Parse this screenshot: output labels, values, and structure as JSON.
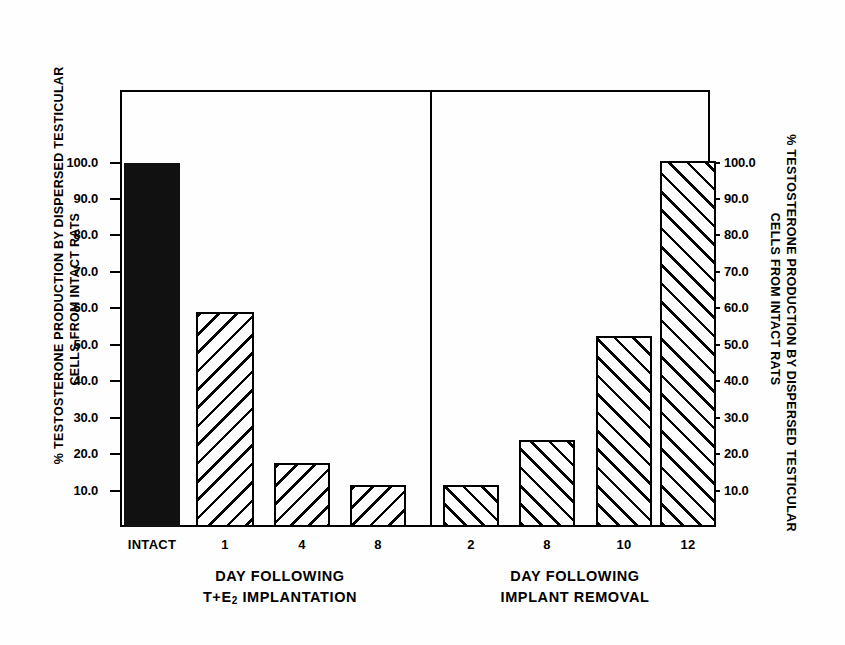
{
  "axis_titles": {
    "left": [
      "% TESTOSTERONE PRODUCTION BY DISPERSED TESTICULAR",
      "CELLS FROM INTACT RATS"
    ],
    "right": [
      "% TESTOSTERONE PRODUCTION BY DISPERSED TESTICULAR",
      "CELLS FROM INTACT RATS"
    ]
  },
  "tick_labels": [
    "100.0",
    "90.0",
    "80.0",
    "70.0",
    "60.0",
    "50.0",
    "40.0",
    "30.0",
    "20.0",
    "10.0"
  ],
  "groups": [
    {
      "caption": [
        "DAY FOLLOWING",
        "T+E2 IMPLANTATION"
      ],
      "caption_line2_pre": "T+E",
      "caption_line2_sub": "2",
      "caption_line2_post": " IMPLANTATION"
    },
    {
      "caption": [
        "DAY FOLLOWING",
        "IMPLANT REMOVAL"
      ]
    }
  ],
  "chart_data": {
    "type": "bar",
    "title": "",
    "xlabel": "",
    "ylabel": "% TESTOSTERONE PRODUCTION BY DISPERSED TESTICULAR CELLS FROM INTACT RATS",
    "ylim": [
      0,
      105
    ],
    "ytick_values": [
      100.0,
      90.0,
      80.0,
      70.0,
      60.0,
      50.0,
      40.0,
      30.0,
      20.0,
      10.0
    ],
    "grid": false,
    "legend": "none",
    "dual_axis": true,
    "categories": [
      "INTACT",
      "1",
      "4",
      "8",
      "2",
      "8",
      "10",
      "12"
    ],
    "values": [
      100.0,
      59.0,
      17.5,
      11.5,
      11.5,
      24.0,
      52.5,
      100.5
    ],
    "panels": [
      {
        "name": "DAY FOLLOWING T+E2 IMPLANTATION",
        "categories": [
          "INTACT",
          "1",
          "4",
          "8"
        ],
        "values": [
          100.0,
          59.0,
          17.5,
          11.5
        ],
        "fills": [
          "solid-black",
          "hatch-backslash",
          "hatch-backslash",
          "hatch-backslash"
        ]
      },
      {
        "name": "DAY FOLLOWING IMPLANT REMOVAL",
        "categories": [
          "2",
          "8",
          "10",
          "12"
        ],
        "values": [
          11.5,
          24.0,
          52.5,
          100.5
        ],
        "fills": [
          "hatch-forwardslash",
          "hatch-forwardslash",
          "hatch-forwardslash",
          "hatch-forwardslash"
        ]
      }
    ]
  },
  "bars": [
    {
      "label": "INTACT",
      "value": 100.0,
      "fill": "solid"
    },
    {
      "label": "1",
      "value": 59.0,
      "fill": "hatch-back"
    },
    {
      "label": "4",
      "value": 17.5,
      "fill": "hatch-back"
    },
    {
      "label": "8",
      "value": 11.5,
      "fill": "hatch-back"
    },
    {
      "label": "2",
      "value": 11.5,
      "fill": "hatch-fwd"
    },
    {
      "label": "8",
      "value": 24.0,
      "fill": "hatch-fwd"
    },
    {
      "label": "10",
      "value": 52.5,
      "fill": "hatch-fwd"
    },
    {
      "label": "12",
      "value": 100.5,
      "fill": "hatch-fwd"
    }
  ],
  "colors": {
    "ink": "#000000",
    "paper": "#fefefe",
    "solid_bar": "#111111"
  }
}
